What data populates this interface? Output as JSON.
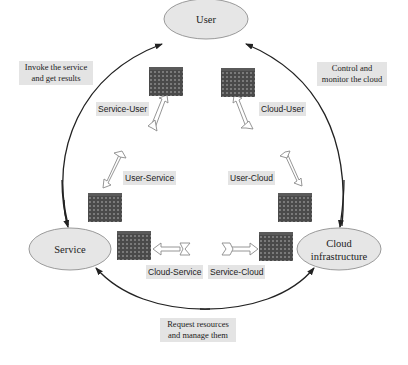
{
  "nodes": {
    "user": "User",
    "service": "Service",
    "cloud_line1": "Cloud",
    "cloud_line2": "infrastructure"
  },
  "edge_labels": {
    "service_to_user_line1": "Invoke the service",
    "service_to_user_line2": "and get results",
    "cloud_to_user_line1": "Control and",
    "cloud_to_user_line2": "monitor the cloud",
    "service_to_cloud_line1": "Request resources",
    "service_to_cloud_line2": "and manage them"
  },
  "interface_labels": {
    "service_user": "Service-User",
    "cloud_user": "Cloud-User",
    "user_service": "User-Service",
    "user_cloud": "User-Cloud",
    "cloud_service": "Cloud-Service",
    "service_cloud": "Service-Cloud"
  },
  "colors": {
    "node_fill": "#e6e6e6",
    "node_stroke": "#999999",
    "label_bg": "#e4e4e4",
    "firewall": "#4a4a4a",
    "edge": "#222222"
  }
}
